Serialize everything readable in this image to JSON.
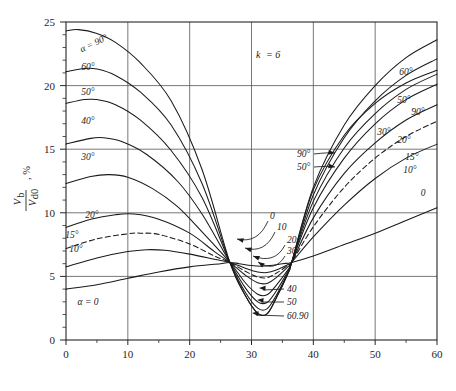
{
  "chart_data": {
    "type": "line",
    "title": "",
    "xlabel": "Overlap Angle u, Deg.",
    "ylabel": "V_b / V_d0 , %",
    "ylabel_num": "V",
    "ylabel_num_sub": "b",
    "ylabel_den": "V",
    "ylabel_den_sub": "d0",
    "ylabel_pct": ", %",
    "xlim": [
      0,
      60
    ],
    "ylim": [
      0,
      25
    ],
    "xticks": [
      0,
      10,
      20,
      30,
      40,
      50,
      60
    ],
    "yticks": [
      0,
      5,
      10,
      15,
      20,
      25
    ],
    "x_minor_step": 5,
    "y_minor_step": 1,
    "grid": "major-both",
    "annotation_note": "k = 6",
    "annotation_note_k": "k",
    "annotation_note_eq": "= 6",
    "legend_position": "inline-curve-labels",
    "series": [
      {
        "name": "alpha = 0",
        "label": "α = 0",
        "dashed": false,
        "points": [
          [
            0,
            4.0
          ],
          [
            5,
            4.35
          ],
          [
            10,
            4.85
          ],
          [
            15,
            5.35
          ],
          [
            20,
            5.75
          ],
          [
            25,
            6.0
          ],
          [
            26.5,
            6.1
          ],
          [
            28,
            6.0
          ],
          [
            30,
            5.85
          ],
          [
            31.5,
            5.8
          ],
          [
            33,
            5.85
          ],
          [
            35,
            6.0
          ],
          [
            36.5,
            6.1
          ],
          [
            40,
            6.6
          ],
          [
            45,
            7.5
          ],
          [
            50,
            8.4
          ],
          [
            55,
            9.4
          ],
          [
            60,
            10.4
          ]
        ]
      },
      {
        "name": "alpha = 10",
        "label": "10°",
        "dashed": false,
        "points": [
          [
            0,
            5.75
          ],
          [
            5,
            6.45
          ],
          [
            10,
            6.95
          ],
          [
            13,
            7.1
          ],
          [
            16,
            7.05
          ],
          [
            20,
            6.75
          ],
          [
            24,
            6.35
          ],
          [
            26.5,
            6.1
          ],
          [
            29,
            5.65
          ],
          [
            31,
            5.35
          ],
          [
            32.5,
            5.3
          ],
          [
            34,
            5.5
          ],
          [
            36,
            5.95
          ],
          [
            36.5,
            6.1
          ],
          [
            40,
            8.1
          ],
          [
            45,
            10.6
          ],
          [
            50,
            12.7
          ],
          [
            55,
            14.3
          ],
          [
            60,
            15.4
          ]
        ]
      },
      {
        "name": "alpha = 15",
        "label": "15°",
        "dashed": true,
        "points": [
          [
            0,
            7.2
          ],
          [
            5,
            7.95
          ],
          [
            10,
            8.35
          ],
          [
            12,
            8.4
          ],
          [
            15,
            8.3
          ],
          [
            20,
            7.55
          ],
          [
            24,
            6.6
          ],
          [
            26.5,
            6.1
          ],
          [
            29,
            5.4
          ],
          [
            31,
            4.95
          ],
          [
            32.5,
            4.9
          ],
          [
            34,
            5.25
          ],
          [
            36,
            5.9
          ],
          [
            36.5,
            6.1
          ],
          [
            40,
            8.9
          ],
          [
            45,
            12.0
          ],
          [
            50,
            14.3
          ],
          [
            55,
            16.0
          ],
          [
            60,
            17.2
          ]
        ]
      },
      {
        "name": "alpha = 20",
        "label": "20°",
        "dashed": false,
        "points": [
          [
            0,
            8.85
          ],
          [
            4,
            9.5
          ],
          [
            8,
            9.85
          ],
          [
            11,
            9.9
          ],
          [
            15,
            9.5
          ],
          [
            20,
            8.4
          ],
          [
            24,
            6.95
          ],
          [
            26.5,
            6.1
          ],
          [
            29,
            5.1
          ],
          [
            31,
            4.5
          ],
          [
            32.5,
            4.45
          ],
          [
            34,
            4.9
          ],
          [
            36,
            5.8
          ],
          [
            36.5,
            6.1
          ],
          [
            40,
            9.6
          ],
          [
            45,
            13.1
          ],
          [
            50,
            15.5
          ],
          [
            55,
            17.3
          ],
          [
            60,
            18.5
          ]
        ]
      },
      {
        "name": "alpha = 30",
        "label": "30°",
        "dashed": false,
        "points": [
          [
            0,
            12.3
          ],
          [
            4,
            12.85
          ],
          [
            7,
            13.0
          ],
          [
            10,
            12.8
          ],
          [
            14,
            11.9
          ],
          [
            18,
            10.5
          ],
          [
            22,
            8.5
          ],
          [
            26.5,
            6.1
          ],
          [
            29,
            4.5
          ],
          [
            31,
            3.6
          ],
          [
            32.5,
            3.55
          ],
          [
            34,
            4.3
          ],
          [
            36,
            5.6
          ],
          [
            36.5,
            6.1
          ],
          [
            40,
            10.4
          ],
          [
            45,
            14.3
          ],
          [
            50,
            17.0
          ],
          [
            55,
            18.9
          ],
          [
            60,
            20.1
          ]
        ]
      },
      {
        "name": "alpha = 40",
        "label": "40°",
        "dashed": false,
        "points": [
          [
            0,
            15.4
          ],
          [
            4,
            15.85
          ],
          [
            6,
            15.9
          ],
          [
            9,
            15.6
          ],
          [
            13,
            14.6
          ],
          [
            18,
            12.5
          ],
          [
            22,
            9.9
          ],
          [
            26.5,
            6.1
          ],
          [
            29,
            4.1
          ],
          [
            31,
            3.0
          ],
          [
            32.5,
            2.95
          ],
          [
            34,
            3.85
          ],
          [
            36,
            5.5
          ],
          [
            36.5,
            6.1
          ],
          [
            40,
            10.9
          ],
          [
            45,
            15.1
          ],
          [
            50,
            17.8
          ],
          [
            55,
            19.7
          ],
          [
            60,
            20.9
          ]
        ]
      },
      {
        "name": "alpha = 50",
        "label": "50°",
        "dashed": false,
        "points": [
          [
            0,
            18.6
          ],
          [
            3,
            18.9
          ],
          [
            5,
            18.9
          ],
          [
            8,
            18.5
          ],
          [
            12,
            17.3
          ],
          [
            17,
            14.9
          ],
          [
            22,
            11.2
          ],
          [
            26.5,
            6.1
          ],
          [
            29,
            3.75
          ],
          [
            31,
            2.5
          ],
          [
            32.5,
            2.45
          ],
          [
            34,
            3.5
          ],
          [
            36,
            5.4
          ],
          [
            36.5,
            6.1
          ],
          [
            40,
            11.4
          ],
          [
            45,
            15.9
          ],
          [
            50,
            18.8
          ],
          [
            55,
            20.8
          ],
          [
            60,
            22.1
          ]
        ]
      },
      {
        "name": "alpha = 60",
        "label": "60°",
        "dashed": false,
        "points": [
          [
            0,
            21.1
          ],
          [
            3,
            21.35
          ],
          [
            5,
            21.3
          ],
          [
            8,
            20.8
          ],
          [
            12,
            19.5
          ],
          [
            17,
            16.9
          ],
          [
            22,
            12.3
          ],
          [
            26.5,
            6.1
          ],
          [
            29,
            3.5
          ],
          [
            31,
            2.1
          ],
          [
            32.5,
            2.05
          ],
          [
            34,
            3.3
          ],
          [
            36,
            5.35
          ],
          [
            36.5,
            6.1
          ],
          [
            40,
            12.0
          ],
          [
            45,
            16.9
          ],
          [
            50,
            20.0
          ],
          [
            55,
            22.2
          ],
          [
            60,
            23.6
          ]
        ]
      },
      {
        "name": "alpha = 90",
        "label": "α = 90°",
        "dashed": false,
        "points": [
          [
            0,
            24.3
          ],
          [
            2,
            24.4
          ],
          [
            5,
            24.1
          ],
          [
            8,
            23.4
          ],
          [
            12,
            21.8
          ],
          [
            17,
            18.8
          ],
          [
            22,
            13.4
          ],
          [
            26.5,
            6.1
          ],
          [
            29,
            3.5
          ],
          [
            31,
            2.1
          ],
          [
            32.5,
            2.05
          ],
          [
            34,
            3.3
          ],
          [
            36,
            5.35
          ],
          [
            36.5,
            6.1
          ],
          [
            40,
            11.8
          ],
          [
            45,
            16.1
          ],
          [
            50,
            18.6
          ],
          [
            55,
            20.2
          ],
          [
            60,
            21.2
          ]
        ]
      }
    ],
    "left_curve_labels": [
      {
        "text": "α = 90°",
        "x": 95,
        "y": 46,
        "rot": -26
      },
      {
        "text": "60°",
        "x": 88,
        "y": 70,
        "rot": 0
      },
      {
        "text": "50°",
        "x": 88,
        "y": 95,
        "rot": 0
      },
      {
        "text": "40°",
        "x": 88,
        "y": 124,
        "rot": 0
      },
      {
        "text": "30°",
        "x": 88,
        "y": 160,
        "rot": 0
      },
      {
        "text": "20°",
        "x": 92,
        "y": 218,
        "rot": 0
      },
      {
        "text": "15°",
        "x": 72,
        "y": 238,
        "rot": 0
      },
      {
        "text": "10°",
        "x": 76,
        "y": 252,
        "rot": 0
      },
      {
        "text": "α = 0",
        "x": 88,
        "y": 305,
        "rot": 0
      }
    ],
    "right_curve_labels": [
      {
        "text": "60°",
        "x": 406,
        "y": 75
      },
      {
        "text": "50°",
        "x": 404,
        "y": 103
      },
      {
        "text": "90°",
        "x": 418,
        "y": 115
      },
      {
        "text": "30°",
        "x": 384,
        "y": 135
      },
      {
        "text": "20°",
        "x": 404,
        "y": 143
      },
      {
        "text": "15°",
        "x": 412,
        "y": 160
      },
      {
        "text": "10°",
        "x": 410,
        "y": 173
      },
      {
        "text": "0",
        "x": 423,
        "y": 196
      }
    ],
    "arrow_labels_left_pinch": [
      {
        "text": "90°",
        "x": 297,
        "y": 157
      },
      {
        "text": "50°",
        "x": 297,
        "y": 170
      }
    ],
    "arrow_labels_dip_upper": [
      {
        "text": "0",
        "x": 270,
        "y": 219
      },
      {
        "text": "10",
        "x": 277,
        "y": 230
      },
      {
        "text": "20",
        "x": 287,
        "y": 243
      },
      {
        "text": "30",
        "x": 287,
        "y": 254
      }
    ],
    "arrow_labels_dip_lower": [
      {
        "text": "40",
        "x": 287,
        "y": 292
      },
      {
        "text": "50",
        "x": 287,
        "y": 305
      },
      {
        "text": "60.90",
        "x": 287,
        "y": 319
      }
    ]
  }
}
